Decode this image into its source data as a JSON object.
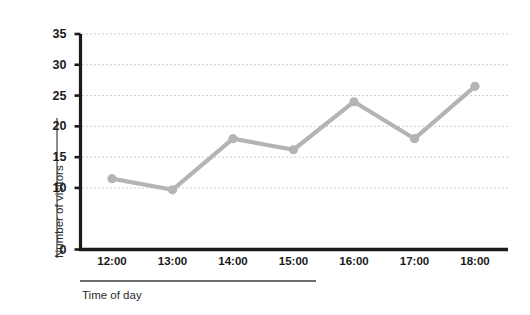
{
  "chart_data": {
    "type": "line",
    "title": "",
    "xlabel": "Time of day",
    "ylabel": "Number of visitors",
    "categories": [
      "12:00",
      "13:00",
      "14:00",
      "15:00",
      "16:00",
      "17:00",
      "18:00"
    ],
    "values": [
      11.5,
      9.7,
      18,
      16.2,
      24,
      18,
      26.5
    ],
    "series": [
      {
        "name": "Number of visitors",
        "values": [
          11.5,
          9.7,
          18,
          16.2,
          24,
          18,
          26.5
        ]
      }
    ],
    "ylim": [
      0,
      35
    ],
    "ytick_values": [
      0,
      10,
      15,
      20,
      25,
      30,
      35
    ],
    "ytick_labels": [
      "0",
      "10",
      "15",
      "20",
      "25",
      "30",
      "35"
    ],
    "xtick_labels": [
      "12:00",
      "13:00",
      "14:00",
      "15:00",
      "16:00",
      "17:00",
      "18:00"
    ],
    "grid": true,
    "grid_style": "dotted",
    "legend": "none",
    "marker": "circle",
    "line_color": "#b4b4b4",
    "marker_color": "#b4b4b4",
    "grid_color": "#b9b9b9",
    "axis_color": "#1a1a1a",
    "background_color": "#ffffff"
  }
}
